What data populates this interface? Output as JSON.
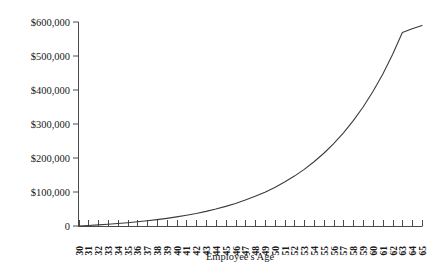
{
  "chart_data": {
    "type": "line",
    "title": "",
    "xlabel": "Employee's Age",
    "ylabel": "",
    "grid": false,
    "legend": null,
    "xlim": [
      30,
      65
    ],
    "ylim": [
      0,
      600000
    ],
    "ytick_labels": [
      "$600,000",
      "$500,000",
      "$400,000",
      "$300,000",
      "$200,000",
      "$100,000",
      "0"
    ],
    "ytick_values": [
      600000,
      500000,
      400000,
      300000,
      200000,
      100000,
      0
    ],
    "xtick_labels": [
      "30",
      "31",
      "32",
      "33",
      "34",
      "35",
      "36",
      "37",
      "38",
      "39",
      "40",
      "41",
      "42",
      "43",
      "44",
      "45",
      "46",
      "47",
      "48",
      "49",
      "50",
      "51",
      "52",
      "53",
      "54",
      "55",
      "56",
      "57",
      "58",
      "59",
      "60",
      "61",
      "62",
      "63",
      "64",
      "65"
    ],
    "x": [
      30,
      31,
      32,
      33,
      34,
      35,
      36,
      37,
      38,
      39,
      40,
      41,
      42,
      43,
      44,
      45,
      46,
      47,
      48,
      49,
      50,
      51,
      52,
      53,
      54,
      55,
      56,
      57,
      58,
      59,
      60,
      61,
      62,
      63,
      64,
      65
    ],
    "values": [
      0,
      1500,
      3200,
      5100,
      7200,
      9600,
      12300,
      15300,
      18700,
      22500,
      26800,
      31600,
      37000,
      43100,
      50000,
      57700,
      66400,
      76200,
      87200,
      99600,
      113500,
      129200,
      146800,
      166600,
      188900,
      214000,
      242200,
      274000,
      309800,
      350100,
      395500,
      446600,
      504200,
      569000,
      580000,
      590000
    ],
    "series": [
      {
        "name": "Accumulated value",
        "values": [
          0,
          1500,
          3200,
          5100,
          7200,
          9600,
          12300,
          15300,
          18700,
          22500,
          26800,
          31600,
          37000,
          43100,
          50000,
          57700,
          66400,
          76200,
          87200,
          99600,
          113500,
          129200,
          146800,
          166600,
          188900,
          214000,
          242200,
          274000,
          309800,
          350100,
          395500,
          446600,
          504200,
          569000,
          580000,
          590000
        ],
        "color": "#3b3b3b"
      }
    ],
    "annotations": []
  },
  "colors": {
    "curve": "#3b3b3b",
    "axis": "#4a4a4a",
    "text": "#1a1a1a",
    "background": "#ffffff"
  }
}
